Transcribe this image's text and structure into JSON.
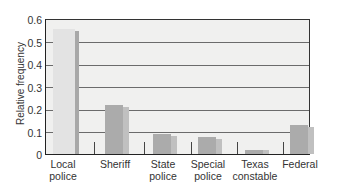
{
  "chart_data": {
    "type": "bar",
    "title": "",
    "xlabel": "",
    "ylabel": "Relative frequency",
    "ylim": [
      0,
      0.6
    ],
    "yticks": [
      "0",
      "0.1",
      "0.2",
      "0.3",
      "0.4",
      "0.5",
      "0.6"
    ],
    "grid": true,
    "legend": null,
    "categories": [
      "Local police",
      "Sheriff",
      "State police",
      "Special police",
      "Texas constable",
      "Federal"
    ],
    "category_lines": [
      [
        "Local",
        "police"
      ],
      [
        "Sheriff",
        ""
      ],
      [
        "State",
        "police"
      ],
      [
        "Special",
        "police"
      ],
      [
        "Texas",
        "constable"
      ],
      [
        "Federal",
        ""
      ]
    ],
    "series": [
      {
        "name": "Series A",
        "values": [
          0.56,
          0.22,
          0.09,
          0.075,
          0.02,
          0.13
        ]
      },
      {
        "name": "Series B",
        "values": [
          0.55,
          0.21,
          0.08,
          0.065,
          0.02,
          0.12
        ]
      }
    ]
  }
}
